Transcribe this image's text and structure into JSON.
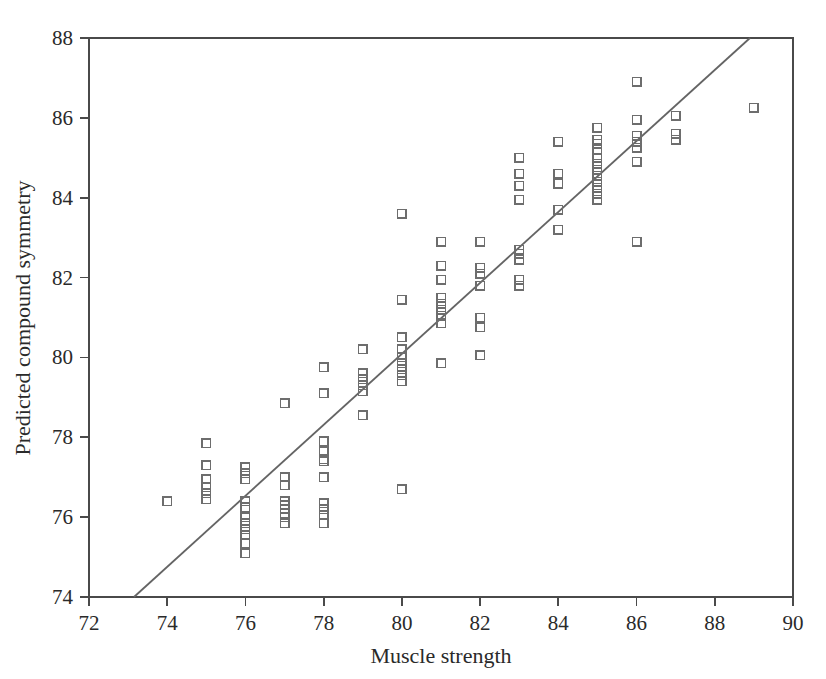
{
  "chart_data": {
    "type": "scatter",
    "title": "",
    "xlabel": "Muscle strength",
    "ylabel": "Predicted compound symmetry",
    "xlim": [
      72,
      90
    ],
    "ylim": [
      74,
      88
    ],
    "xticks": [
      72,
      74,
      76,
      78,
      80,
      82,
      84,
      86,
      88,
      90
    ],
    "yticks": [
      74,
      76,
      78,
      80,
      82,
      84,
      86,
      88
    ],
    "grid": false,
    "legend": null,
    "marker": "open-square",
    "marker_color": "#6d6d6d",
    "line_color": "#646464",
    "fit_line": {
      "x": [
        73.15,
        88.9
      ],
      "y": [
        74.0,
        88.0
      ],
      "slope": 0.889,
      "intercept": 8.96
    },
    "points": [
      [
        74.0,
        76.4
      ],
      [
        75.0,
        77.85
      ],
      [
        75.0,
        77.3
      ],
      [
        75.0,
        76.95
      ],
      [
        75.0,
        76.75
      ],
      [
        75.0,
        76.6
      ],
      [
        75.0,
        76.45
      ],
      [
        76.0,
        77.25
      ],
      [
        76.0,
        77.1
      ],
      [
        76.0,
        76.95
      ],
      [
        76.0,
        76.4
      ],
      [
        76.0,
        76.25
      ],
      [
        76.0,
        76.0
      ],
      [
        76.0,
        75.85
      ],
      [
        76.0,
        75.7
      ],
      [
        76.0,
        75.55
      ],
      [
        76.0,
        75.35
      ],
      [
        76.0,
        75.1
      ],
      [
        77.0,
        78.85
      ],
      [
        77.0,
        77.0
      ],
      [
        77.0,
        76.8
      ],
      [
        77.0,
        76.4
      ],
      [
        77.0,
        76.3
      ],
      [
        77.0,
        76.2
      ],
      [
        77.0,
        76.1
      ],
      [
        77.0,
        76.0
      ],
      [
        77.0,
        75.85
      ],
      [
        78.0,
        79.75
      ],
      [
        78.0,
        79.1
      ],
      [
        78.0,
        77.9
      ],
      [
        78.0,
        77.65
      ],
      [
        78.0,
        77.4
      ],
      [
        78.0,
        77.0
      ],
      [
        78.0,
        76.35
      ],
      [
        78.0,
        76.2
      ],
      [
        78.0,
        76.05
      ],
      [
        78.0,
        75.85
      ],
      [
        78.0,
        77.45
      ],
      [
        79.0,
        80.2
      ],
      [
        79.0,
        79.6
      ],
      [
        79.0,
        79.45
      ],
      [
        79.0,
        79.3
      ],
      [
        79.0,
        79.15
      ],
      [
        79.0,
        78.55
      ],
      [
        80.0,
        83.6
      ],
      [
        80.0,
        81.45
      ],
      [
        80.0,
        80.5
      ],
      [
        80.0,
        80.2
      ],
      [
        80.0,
        80.0
      ],
      [
        80.0,
        79.85
      ],
      [
        80.0,
        79.7
      ],
      [
        80.0,
        79.55
      ],
      [
        80.0,
        79.4
      ],
      [
        80.0,
        76.7
      ],
      [
        81.0,
        82.9
      ],
      [
        81.0,
        82.3
      ],
      [
        81.0,
        81.95
      ],
      [
        81.0,
        81.5
      ],
      [
        81.0,
        81.35
      ],
      [
        81.0,
        81.2
      ],
      [
        81.0,
        81.05
      ],
      [
        81.0,
        80.85
      ],
      [
        81.0,
        79.85
      ],
      [
        82.0,
        82.9
      ],
      [
        82.0,
        82.25
      ],
      [
        82.0,
        82.1
      ],
      [
        82.0,
        81.8
      ],
      [
        82.0,
        81.0
      ],
      [
        82.0,
        80.75
      ],
      [
        82.0,
        80.05
      ],
      [
        83.0,
        85.0
      ],
      [
        83.0,
        84.6
      ],
      [
        83.0,
        84.3
      ],
      [
        83.0,
        83.95
      ],
      [
        83.0,
        82.7
      ],
      [
        83.0,
        82.6
      ],
      [
        83.0,
        82.45
      ],
      [
        83.0,
        81.95
      ],
      [
        83.0,
        81.8
      ],
      [
        84.0,
        85.4
      ],
      [
        84.0,
        84.6
      ],
      [
        84.0,
        84.35
      ],
      [
        84.0,
        83.7
      ],
      [
        84.0,
        83.2
      ],
      [
        85.0,
        85.75
      ],
      [
        85.0,
        85.45
      ],
      [
        85.0,
        85.35
      ],
      [
        85.0,
        85.2
      ],
      [
        85.0,
        85.0
      ],
      [
        85.0,
        84.85
      ],
      [
        85.0,
        84.7
      ],
      [
        85.0,
        84.55
      ],
      [
        85.0,
        84.4
      ],
      [
        85.0,
        84.25
      ],
      [
        85.0,
        84.1
      ],
      [
        85.0,
        83.95
      ],
      [
        86.0,
        86.9
      ],
      [
        86.0,
        85.95
      ],
      [
        86.0,
        85.55
      ],
      [
        86.0,
        85.4
      ],
      [
        86.0,
        85.25
      ],
      [
        86.0,
        84.9
      ],
      [
        86.0,
        82.9
      ],
      [
        87.0,
        86.05
      ],
      [
        87.0,
        85.6
      ],
      [
        87.0,
        85.45
      ],
      [
        89.0,
        86.25
      ]
    ]
  }
}
